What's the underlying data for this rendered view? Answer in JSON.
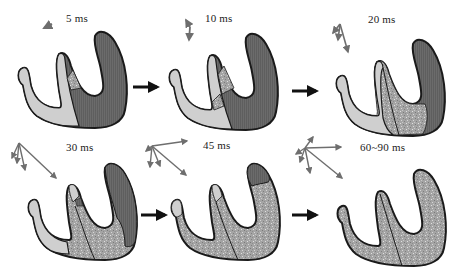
{
  "figure": {
    "colors": {
      "depolarized_dark": "#6b6b6b",
      "resting_light": "#cfcfcf",
      "activated_speckled": "#a8a8a8",
      "outline": "#1a1a1a",
      "vector_arrow": "#6e6e6e",
      "flow_arrow": "#111111"
    },
    "panels": [
      {
        "id": 1,
        "time_label": "5 ms",
        "row": 1,
        "col": 1,
        "vector_count": 1
      },
      {
        "id": 2,
        "time_label": "10 ms",
        "row": 1,
        "col": 2,
        "vector_count": 2
      },
      {
        "id": 3,
        "time_label": "20 ms",
        "row": 1,
        "col": 3,
        "vector_count": 3
      },
      {
        "id": 4,
        "time_label": "30 ms",
        "row": 2,
        "col": 1,
        "vector_count": 4
      },
      {
        "id": 5,
        "time_label": "45 ms",
        "row": 2,
        "col": 2,
        "vector_count": 5
      },
      {
        "id": 6,
        "time_label": "60~90 ms",
        "row": 2,
        "col": 3,
        "vector_count": 6
      }
    ],
    "flow_arrows": [
      {
        "from": 1,
        "to": 2
      },
      {
        "from": 2,
        "to": 3
      },
      {
        "from": 4,
        "to": 5
      },
      {
        "from": 5,
        "to": 6
      }
    ]
  }
}
